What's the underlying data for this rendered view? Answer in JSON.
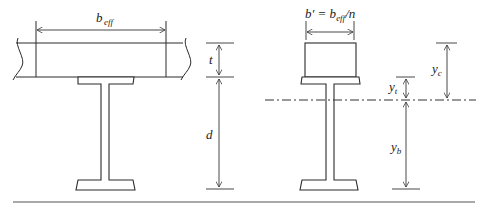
{
  "diagram": {
    "left_section": {
      "name": "Composite section",
      "labels": {
        "width_main": "b",
        "width_sub": "eff",
        "slab_thickness": "t",
        "depth": "d"
      }
    },
    "right_section": {
      "name": "Transformed section",
      "labels": {
        "transformed_width": "b′ = b",
        "transformed_width_sub": "eff",
        "transformed_width_tail": "/n",
        "yt_main": "y",
        "yt_sub": "t",
        "yc_main": "y",
        "yc_sub": "c",
        "yb_main": "y",
        "yb_sub": "b"
      }
    },
    "colors": {
      "line": "#2b2b2b",
      "rule": "#555555"
    }
  }
}
